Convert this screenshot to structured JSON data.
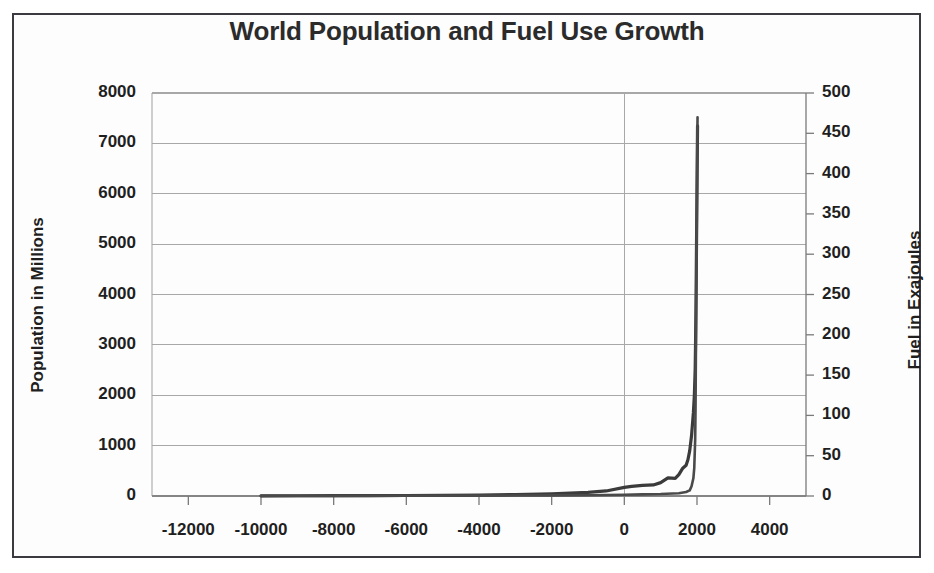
{
  "chart_data": {
    "type": "line",
    "title": "World Population and Fuel Use Growth",
    "xlabel": "",
    "ylabel": "Population in Millions",
    "y2label": "Fuel in Exajoules",
    "xlim": [
      -13000,
      5000
    ],
    "ylim": [
      0,
      8000
    ],
    "y2lim": [
      0,
      500
    ],
    "grid": true,
    "legend": "none",
    "xticks": [
      -12000,
      -10000,
      -8000,
      -6000,
      -4000,
      -2000,
      0,
      2000,
      4000
    ],
    "xtick_labels": [
      "-12000",
      "-10000",
      "-8000",
      "-6000",
      "-4000",
      "-2000",
      "0",
      "2000",
      "4000"
    ],
    "yticks": [
      0,
      1000,
      2000,
      3000,
      4000,
      5000,
      6000,
      7000,
      8000
    ],
    "ytick_labels": [
      "0",
      "1000",
      "2000",
      "3000",
      "4000",
      "5000",
      "6000",
      "7000",
      "8000"
    ],
    "y2ticks": [
      0,
      50,
      100,
      150,
      200,
      250,
      300,
      350,
      400,
      450,
      500
    ],
    "y2tick_labels": [
      "0",
      "50",
      "100",
      "150",
      "200",
      "250",
      "300",
      "350",
      "400",
      "450",
      "500"
    ],
    "series": [
      {
        "name": "Population in Millions",
        "axis": "left",
        "color": "#3b3b3b",
        "x": [
          -10000,
          -9000,
          -8000,
          -7000,
          -6000,
          -5000,
          -4000,
          -3000,
          -2000,
          -1000,
          -500,
          0,
          200,
          500,
          800,
          1000,
          1200,
          1400,
          1500,
          1600,
          1700,
          1750,
          1800,
          1850,
          1900,
          1927,
          1950,
          1960,
          1970,
          1980,
          1990,
          2000,
          2010,
          2015
        ],
        "y": [
          4,
          5,
          6,
          8,
          10,
          14,
          20,
          30,
          45,
          72,
          100,
          170,
          190,
          210,
          220,
          265,
          360,
          350,
          425,
          545,
          610,
          720,
          900,
          1200,
          1650,
          2000,
          2520,
          3030,
          3700,
          4440,
          5300,
          6120,
          6920,
          7350
        ]
      },
      {
        "name": "Fuel in Exajoules",
        "axis": "right",
        "color": "#4a4a4a",
        "x": [
          -10000,
          -8000,
          -6000,
          -4000,
          -2000,
          -1000,
          0,
          500,
          1000,
          1500,
          1700,
          1800,
          1850,
          1900,
          1925,
          1950,
          1960,
          1970,
          1980,
          1990,
          2000,
          2010,
          2015
        ],
        "y": [
          0.1,
          0.2,
          0.3,
          0.5,
          0.8,
          1.0,
          1.5,
          2.0,
          2.5,
          3.5,
          5,
          7,
          12,
          22,
          35,
          70,
          110,
          180,
          250,
          320,
          380,
          450,
          470
        ]
      }
    ],
    "annotations": []
  },
  "figure": {
    "title": "World Population and Fuel Use Growth",
    "left_axis_title": "Population in Millions",
    "right_axis_title": "Fuel in Exajoules"
  },
  "colors": {
    "line": "#3b3b3b",
    "grid": "#a8a8a8",
    "axis": "#7a7a7a",
    "border": "#3a3a40",
    "text": "#1f1f1f",
    "background": "#ffffff"
  }
}
